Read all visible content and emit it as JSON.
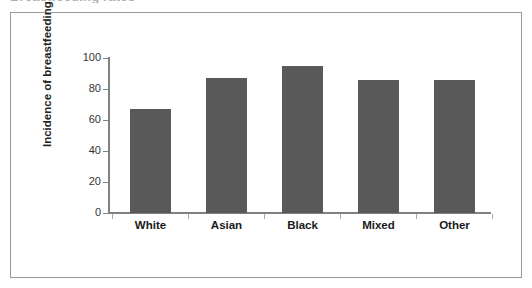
{
  "figure": {
    "caption_sliver": "Breastfeeding rates",
    "frame_color": "#9a9a9a",
    "background": "#ffffff"
  },
  "chart_data": {
    "type": "bar",
    "title": "",
    "xlabel": "",
    "ylabel": "Incidence of breastfeeding (%)",
    "categories": [
      "White",
      "Asian",
      "Black",
      "Mixed",
      "Other"
    ],
    "values": [
      67,
      87,
      95,
      86,
      86
    ],
    "ylim": [
      0,
      100
    ],
    "yticks": [
      0,
      20,
      40,
      60,
      80,
      100
    ],
    "ytick_labels": [
      "0",
      "20",
      "40",
      "60",
      "80",
      "100"
    ],
    "grid": false,
    "legend": false,
    "bar_color": "#595959",
    "axis_color": "#808080"
  }
}
